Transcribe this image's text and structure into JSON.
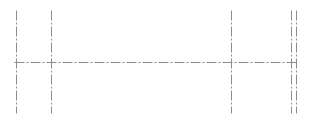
{
  "diagram": {
    "type": "centerlines",
    "width": 311,
    "height": 123,
    "line_color": "#8c8c8c",
    "line_style": "dash-dot",
    "dash_pattern": [
      10,
      2,
      2,
      2
    ],
    "horizontal_lines": [
      {
        "y": 62,
        "x1": 14,
        "x2": 298
      }
    ],
    "vertical_lines": [
      {
        "x": 16,
        "y1": 10,
        "y2": 113
      },
      {
        "x": 51,
        "y1": 10,
        "y2": 113
      },
      {
        "x": 231,
        "y1": 10,
        "y2": 113
      },
      {
        "x": 291,
        "y1": 10,
        "y2": 113
      },
      {
        "x": 296,
        "y1": 10,
        "y2": 113
      }
    ]
  }
}
